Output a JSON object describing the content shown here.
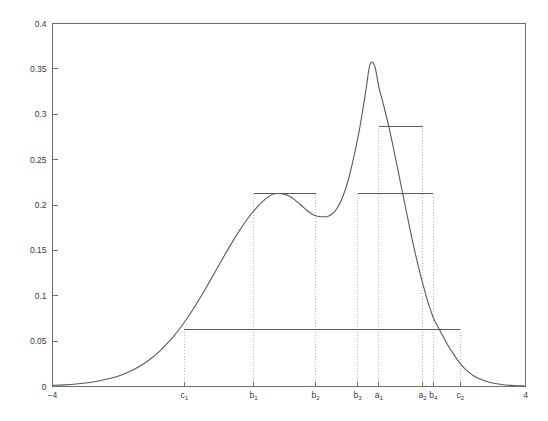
{
  "chart_data": {
    "type": "line",
    "title": "",
    "subtitle": "",
    "xlabel": "",
    "ylabel": "",
    "xlim": [
      -4,
      4
    ],
    "ylim": [
      0,
      0.4
    ],
    "grid": false,
    "legend": null,
    "x_ticks": [
      {
        "value": -4,
        "label": "−4",
        "sub": ""
      },
      {
        "value": -1.77,
        "label": "c",
        "sub": "1"
      },
      {
        "value": -0.6,
        "label": "b",
        "sub": "1"
      },
      {
        "value": 0.45,
        "label": "b",
        "sub": "2"
      },
      {
        "value": 1.16,
        "label": "b",
        "sub": "3"
      },
      {
        "value": 1.52,
        "label": "a",
        "sub": "1"
      },
      {
        "value": 2.26,
        "label": "a",
        "sub": "2"
      },
      {
        "value": 2.44,
        "label": "b",
        "sub": "4"
      },
      {
        "value": 2.9,
        "label": "c",
        "sub": "2"
      },
      {
        "value": 4,
        "label": "4",
        "sub": ""
      }
    ],
    "y_ticks": [
      {
        "value": 0,
        "label": "0"
      },
      {
        "value": 0.05,
        "label": "0.05"
      },
      {
        "value": 0.1,
        "label": "0.1"
      },
      {
        "value": 0.15,
        "label": "0.15"
      },
      {
        "value": 0.2,
        "label": "0.2"
      },
      {
        "value": 0.25,
        "label": "0.25"
      },
      {
        "value": 0.3,
        "label": "0.3"
      },
      {
        "value": 0.35,
        "label": "0.35"
      },
      {
        "value": 0.4,
        "label": "0.4"
      }
    ],
    "series": [
      {
        "name": "density",
        "comment": "Bimodal mixture density f(x). Local max 0.241 at x=-0.27, local min 0.187 at x=0.63, global max 0.356 at x=1.37.",
        "x": [
          -4.0,
          -3.8,
          -3.6,
          -3.4,
          -3.2,
          -3.0,
          -2.8,
          -2.6,
          -2.4,
          -2.2,
          -2.0,
          -1.9,
          -1.8,
          -1.7,
          -1.6,
          -1.5,
          -1.4,
          -1.3,
          -1.2,
          -1.1,
          -1.0,
          -0.9,
          -0.8,
          -0.7,
          -0.6,
          -0.5,
          -0.4,
          -0.3,
          -0.27,
          -0.2,
          -0.1,
          0.0,
          0.1,
          0.2,
          0.3,
          0.4,
          0.5,
          0.6,
          0.63,
          0.7,
          0.8,
          0.9,
          1.0,
          1.1,
          1.16,
          1.2,
          1.3,
          1.37,
          1.45,
          1.52,
          1.6,
          1.7,
          1.8,
          1.9,
          2.0,
          2.1,
          2.2,
          2.26,
          2.35,
          2.44,
          2.5,
          2.6,
          2.7,
          2.8,
          2.9,
          3.0,
          3.1,
          3.2,
          3.4,
          3.6,
          3.8,
          4.0
        ],
        "y": [
          0.0012,
          0.0018,
          0.0028,
          0.0042,
          0.0063,
          0.0093,
          0.0136,
          0.0195,
          0.0276,
          0.0382,
          0.0517,
          0.0595,
          0.0681,
          0.0774,
          0.0874,
          0.098,
          0.1091,
          0.1205,
          0.132,
          0.1435,
          0.1547,
          0.1654,
          0.1755,
          0.1848,
          0.1931,
          0.2004,
          0.2065,
          0.2112,
          0.212,
          0.2127,
          0.2123,
          0.21,
          0.2057,
          0.2,
          0.1942,
          0.1896,
          0.1873,
          0.187,
          0.1871,
          0.1887,
          0.1951,
          0.2075,
          0.227,
          0.254,
          0.273,
          0.286,
          0.326,
          0.355,
          0.353,
          0.33,
          0.31,
          0.283,
          0.252,
          0.22,
          0.188,
          0.157,
          0.129,
          0.114,
          0.093,
          0.076,
          0.068,
          0.056,
          0.044,
          0.034,
          0.025,
          0.018,
          0.0128,
          0.0091,
          0.0045,
          0.0022,
          0.0011,
          0.0006
        ]
      }
    ],
    "level_sets": [
      {
        "name": "lambda-c",
        "level": 0.063,
        "from_label": "c1",
        "from_x": -1.77,
        "to_label": "c2",
        "to_x": 2.9,
        "segments": [
          [
            -1.77,
            2.9
          ]
        ]
      },
      {
        "name": "lambda-b",
        "level": 0.213,
        "from_label": "b1",
        "from_x": -0.6,
        "to_label": "b4",
        "to_x": 2.44,
        "segments": [
          [
            -0.6,
            0.45
          ],
          [
            1.16,
            2.44
          ]
        ]
      },
      {
        "name": "lambda-a",
        "level": 0.287,
        "from_label": "a1",
        "from_x": 1.52,
        "to_label": "a2",
        "to_x": 2.26,
        "segments": [
          [
            1.52,
            2.26
          ]
        ]
      }
    ],
    "drop_lines": [
      {
        "label": "c1",
        "x": -1.77,
        "top_value": 0.063
      },
      {
        "label": "b1",
        "x": -0.6,
        "top_value": 0.213
      },
      {
        "label": "b2",
        "x": 0.45,
        "top_value": 0.213
      },
      {
        "label": "b3",
        "x": 1.16,
        "top_value": 0.213
      },
      {
        "label": "a1",
        "x": 1.52,
        "top_value": 0.287
      },
      {
        "label": "a2",
        "x": 2.26,
        "top_value": 0.287
      },
      {
        "label": "b4",
        "x": 2.44,
        "top_value": 0.213
      },
      {
        "label": "c2",
        "x": 2.9,
        "top_value": 0.063
      }
    ],
    "colors": {
      "curve": "#5a5a5a",
      "axis": "#6e6e6e",
      "dropline": "#b9b9b9",
      "level_line": "#5a5a5a",
      "background": "#ffffff",
      "text": "#3a3a3a"
    }
  }
}
